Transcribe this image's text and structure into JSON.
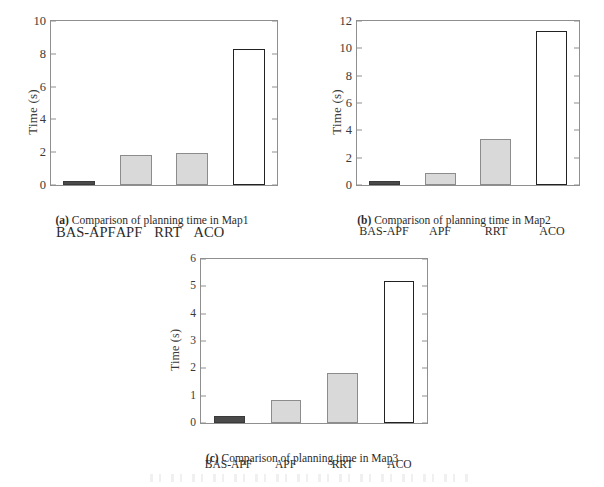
{
  "figure": {
    "background": "#ffffff",
    "series_colors": {
      "bas_apf": "#4a4a4a",
      "apf": "#d9d9d9",
      "rrt": "#d9d9d9",
      "aco": "#ffffff",
      "outline": "#222222"
    }
  },
  "chart_data": [
    {
      "type": "bar",
      "panel": "a",
      "title": "",
      "caption_tag": "(a)",
      "caption_text": " Comparison of planning time in Map1",
      "xlabel": "",
      "ylabel": "Time (s)",
      "categories": [
        "BAS-APF",
        "APF",
        "RRT",
        "ACO"
      ],
      "values": [
        0.27,
        1.82,
        1.96,
        8.32
      ],
      "yticks": [
        0,
        2,
        4,
        6,
        8,
        10
      ],
      "ylim": [
        0,
        10
      ],
      "grid": false,
      "legend": "none"
    },
    {
      "type": "bar",
      "panel": "b",
      "title": "",
      "caption_tag": "(b)",
      "caption_text": " Comparison of planning time in Map2",
      "xlabel": "",
      "ylabel": "Time (s)",
      "categories": [
        "BAS-APF",
        "APF",
        "RRT",
        "ACO"
      ],
      "values": [
        0.28,
        0.9,
        3.38,
        11.3
      ],
      "yticks": [
        0,
        2,
        4,
        6,
        8,
        10,
        12
      ],
      "ylim": [
        0,
        12
      ],
      "grid": false,
      "legend": "none"
    },
    {
      "type": "bar",
      "panel": "c",
      "title": "",
      "caption_tag": "(c)",
      "caption_text": " Comparison of planning time in Map3",
      "xlabel": "",
      "ylabel": "Time (s)",
      "categories": [
        "BAS-APF",
        "APF",
        "RRT",
        "ACO"
      ],
      "values": [
        0.25,
        0.83,
        1.83,
        5.18
      ],
      "yticks": [
        0,
        1,
        2,
        3,
        4,
        5,
        6
      ],
      "ylim": [
        0,
        6
      ],
      "grid": false,
      "legend": "none"
    }
  ],
  "panels": {
    "a": {
      "ylabel": "Time (s)",
      "yticks": [
        "10",
        "8",
        "6",
        "4",
        "2",
        "0"
      ],
      "xlabels": [
        "BAS-APF",
        "APF",
        "RRT",
        "ACO"
      ],
      "caption_tag": "(a)",
      "caption_text": " Comparison of planning time in Map1"
    },
    "b": {
      "ylabel": "Time (s)",
      "yticks": [
        "12",
        "10",
        "8",
        "6",
        "4",
        "2",
        "0"
      ],
      "xlabels": [
        "BAS-APF",
        "APF",
        "RRT",
        "ACO"
      ],
      "caption_tag": "(b)",
      "caption_text": " Comparison of planning time in Map2"
    },
    "c": {
      "ylabel": "Time (s)",
      "yticks": [
        "6",
        "5",
        "4",
        "3",
        "2",
        "1",
        "0"
      ],
      "xlabels": [
        "BAS-APF",
        "APF",
        "RRT",
        "ACO"
      ],
      "caption_tag": "(c)",
      "caption_text": " Comparison of planning time in Map3"
    }
  }
}
